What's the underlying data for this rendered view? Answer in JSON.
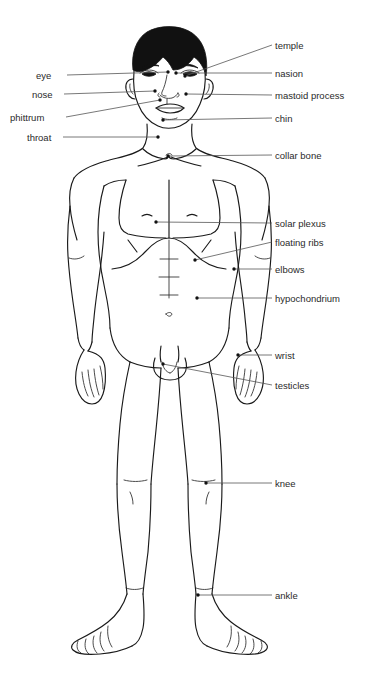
{
  "diagram": {
    "colors": {
      "background": "#ffffff",
      "outline": "#1a1a1a",
      "hair": "#111111",
      "leader_line": "#555555",
      "label_text": "#2a2a2a"
    },
    "labels_left": [
      {
        "id": "eye",
        "text": "eye",
        "x": 36,
        "y": 71,
        "line_x1": 67,
        "line_y1": 75,
        "line_x2": 168,
        "line_y2": 72,
        "dot_x": 168,
        "dot_y": 72
      },
      {
        "id": "nose",
        "text": "nose",
        "x": 32,
        "y": 90,
        "line_x1": 64,
        "line_y1": 94,
        "line_x2": 155,
        "line_y2": 91,
        "dot_x": 155,
        "dot_y": 91
      },
      {
        "id": "phittrum",
        "text": "phittrum",
        "x": 10,
        "y": 113,
        "line_x1": 66,
        "line_y1": 117,
        "line_x2": 160,
        "line_y2": 100,
        "dot_x": 160,
        "dot_y": 100
      },
      {
        "id": "throat",
        "text": "throat",
        "x": 27,
        "y": 133,
        "line_x1": 63,
        "line_y1": 137,
        "line_x2": 158,
        "line_y2": 137,
        "dot_x": 158,
        "dot_y": 137
      }
    ],
    "labels_right": [
      {
        "id": "temple",
        "text": "temple",
        "x": 275,
        "y": 41,
        "line_x1": 272,
        "line_y1": 45,
        "line_x2": 185,
        "line_y2": 76,
        "dot_x": 185,
        "dot_y": 76
      },
      {
        "id": "nasion",
        "text": "nasion",
        "x": 275,
        "y": 69,
        "line_x1": 272,
        "line_y1": 73,
        "line_x2": 176,
        "line_y2": 73,
        "dot_x": 176,
        "dot_y": 73
      },
      {
        "id": "mastoid-process",
        "text": "mastoid process",
        "x": 275,
        "y": 91,
        "line_x1": 272,
        "line_y1": 95,
        "line_x2": 186,
        "line_y2": 94,
        "dot_x": 186,
        "dot_y": 94
      },
      {
        "id": "chin",
        "text": "chin",
        "x": 275,
        "y": 114,
        "line_x1": 272,
        "line_y1": 118,
        "line_x2": 163,
        "line_y2": 120,
        "dot_x": 163,
        "dot_y": 120
      },
      {
        "id": "collar-bone",
        "text": "collar bone",
        "x": 275,
        "y": 151,
        "line_x1": 272,
        "line_y1": 155,
        "line_x2": 168,
        "line_y2": 156,
        "dot_x": 168,
        "dot_y": 156
      },
      {
        "id": "solar-plexus",
        "text": "solar plexus",
        "x": 275,
        "y": 219,
        "line_x1": 272,
        "line_y1": 223,
        "line_x2": 156,
        "line_y2": 222,
        "dot_x": 156,
        "dot_y": 222
      },
      {
        "id": "floating-ribs",
        "text": "floating ribs",
        "x": 275,
        "y": 238,
        "line_x1": 272,
        "line_y1": 242,
        "line_x2": 195,
        "line_y2": 260,
        "dot_x": 195,
        "dot_y": 260
      },
      {
        "id": "elbows",
        "text": "elbows",
        "x": 275,
        "y": 265,
        "line_x1": 272,
        "line_y1": 269,
        "line_x2": 234,
        "line_y2": 269,
        "dot_x": 234,
        "dot_y": 269
      },
      {
        "id": "hypochondrium",
        "text": "hypochondrium",
        "x": 275,
        "y": 294,
        "line_x1": 272,
        "line_y1": 298,
        "line_x2": 197,
        "line_y2": 298,
        "dot_x": 197,
        "dot_y": 298
      },
      {
        "id": "wrist",
        "text": "wrist",
        "x": 275,
        "y": 351,
        "line_x1": 272,
        "line_y1": 355,
        "line_x2": 238,
        "line_y2": 355,
        "dot_x": 238,
        "dot_y": 355
      },
      {
        "id": "testicles",
        "text": "testicles",
        "x": 275,
        "y": 381,
        "line_x1": 272,
        "line_y1": 385,
        "line_x2": 163,
        "line_y2": 364,
        "dot_x": 163,
        "dot_y": 364
      },
      {
        "id": "knee",
        "text": "knee",
        "x": 275,
        "y": 479,
        "line_x1": 272,
        "line_y1": 483,
        "line_x2": 206,
        "line_y2": 483,
        "dot_x": 206,
        "dot_y": 483
      },
      {
        "id": "ankle",
        "text": "ankle",
        "x": 275,
        "y": 591,
        "line_x1": 272,
        "line_y1": 595,
        "line_x2": 198,
        "line_y2": 595,
        "dot_x": 198,
        "dot_y": 595
      }
    ]
  }
}
